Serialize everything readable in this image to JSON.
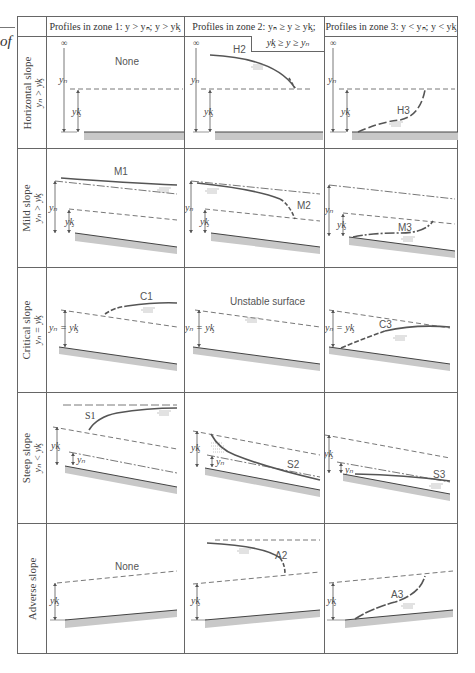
{
  "margin_fragment": "of",
  "table": {
    "headers": [
      "",
      "Profiles in zone 1: y > yₙ; y > yᶄ",
      "Profiles in zone 2: yₙ ≥ y ≥ yᶄ;",
      "Profiles in zone 3: y < yₙ; y < yᶄ"
    ],
    "header_zone2_continuation": "yᶄ ≥ y ≥ yₙ",
    "rows": [
      {
        "slope": "Horizontal slope",
        "condition": "yₙ > yᶄ",
        "zone1": "None",
        "zone2": "H2",
        "zone3": "H3"
      },
      {
        "slope": "Mild slope",
        "condition": "yₙ > yᶄ",
        "zone1": "M1",
        "zone2": "M2",
        "zone3": "M3"
      },
      {
        "slope": "Critical slope",
        "condition": "yₙ = yᶄ",
        "zone1": "C1",
        "zone2": "Unstable surface",
        "zone3": "C3"
      },
      {
        "slope": "Steep slope",
        "condition": "yₙ < yᶄ",
        "zone1": "S1",
        "zone2": "S2",
        "zone3": "S3"
      },
      {
        "slope": "Adverse slope",
        "condition": "",
        "zone1": "None",
        "zone2": "A2",
        "zone3": "A3"
      }
    ]
  },
  "symbols": {
    "infinity": "∞",
    "yn": "yₙ",
    "yc": "yᶄ",
    "yn_eq_yc": "yₙ = yᶄ"
  },
  "colors": {
    "profile": "#555555",
    "bed_fill": "#c8c8c8",
    "grid": "#666666",
    "reference_line": "#555555"
  }
}
